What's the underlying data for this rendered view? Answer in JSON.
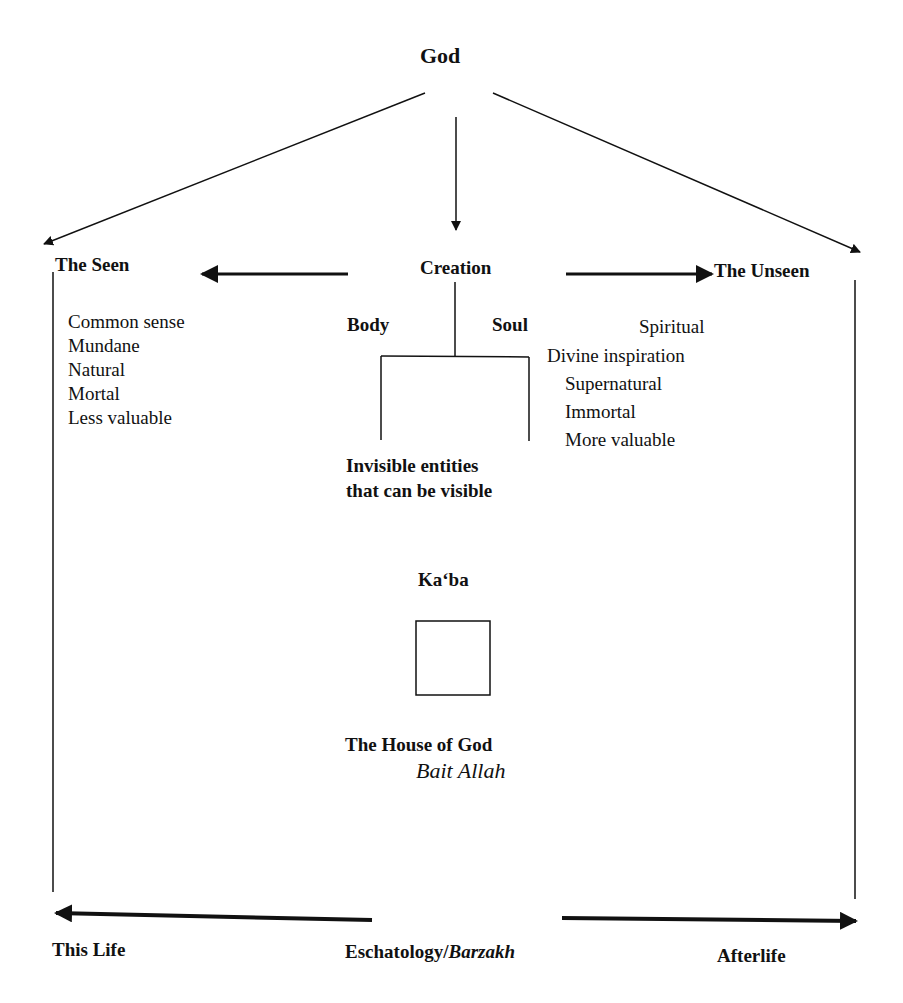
{
  "diagram": {
    "root": "God",
    "creation": "Creation",
    "seen": {
      "label": "The Seen",
      "qualities": [
        "Common sense",
        "Mundane",
        "Natural",
        "Mortal",
        "Less valuable"
      ]
    },
    "unseen": {
      "label": "The Unseen",
      "qualities": [
        "Spiritual",
        "Divine inspiration",
        "Supernatural",
        "Immortal",
        "More valuable"
      ]
    },
    "body": "Body",
    "soul": "Soul",
    "invisible_line1": "Invisible entities",
    "invisible_line2": "that can be visible",
    "kaaba": "Ka‘ba",
    "house_of_god": "The House of God",
    "bait_allah": "Bait Allah",
    "this_life": "This Life",
    "eschatology": "Eschatology/",
    "barzakh": "Barzakh",
    "afterlife": "Afterlife"
  }
}
